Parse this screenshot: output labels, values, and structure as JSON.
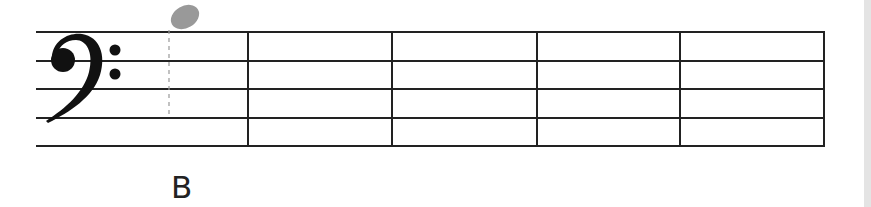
{
  "staff": {
    "clef": "bass",
    "measures": 5,
    "line_color": "#222222"
  },
  "note": {
    "name": "B",
    "position": "ledger-above-staff",
    "color": "#999999"
  },
  "label": "B",
  "icons": {
    "clef": "bass-clef-icon",
    "note": "note-head-icon"
  }
}
